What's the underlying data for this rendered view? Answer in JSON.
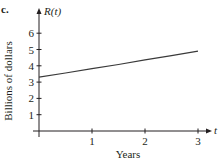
{
  "panel_label": "c.",
  "chart_data": {
    "type": "line",
    "title": "",
    "xlabel": "Years",
    "ylabel": "Billions of dollars",
    "x_axis_name": "t",
    "y_axis_name": "R(t)",
    "x_ticks": [
      1,
      2,
      3
    ],
    "y_ticks": [
      1,
      2,
      3,
      4,
      5,
      6
    ],
    "xlim": [
      0,
      3.3
    ],
    "ylim": [
      0,
      6.6
    ],
    "grid": false,
    "legend": null,
    "series": [
      {
        "name": "R(t)",
        "x": [
          0,
          0.5,
          1,
          1.5,
          2,
          2.5,
          3
        ],
        "values": [
          3.3,
          3.56,
          3.82,
          4.08,
          4.36,
          4.62,
          4.9
        ]
      }
    ]
  },
  "colors": {
    "axis": "#231f20",
    "line": "#3a3a3a"
  }
}
